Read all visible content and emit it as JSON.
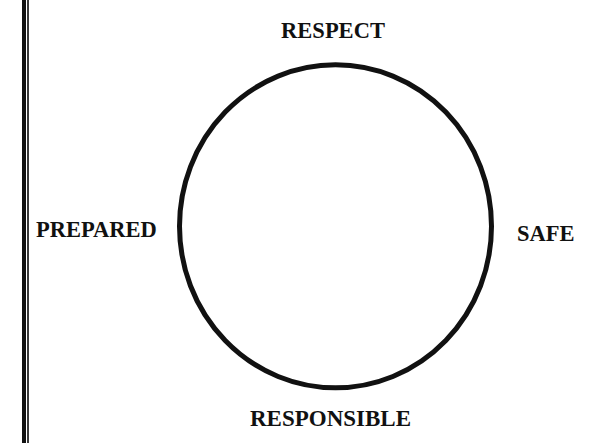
{
  "diagram": {
    "type": "cycle",
    "shape": "circle",
    "stroke_color": "#111111",
    "text_color": "#111111",
    "background_color": "#ffffff",
    "labels": {
      "top": "RESPECT",
      "right": "SAFE",
      "bottom": "RESPONSIBLE",
      "left": "PREPARED"
    }
  },
  "page": {
    "left_border": "double-rule"
  }
}
